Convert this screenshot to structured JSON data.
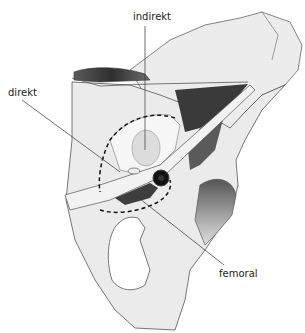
{
  "figure": {
    "type": "anatomical-illustration",
    "labels": {
      "indirect": "indirekt",
      "direct": "direkt",
      "femoral": "femoral"
    },
    "colors": {
      "bone": "#e8e8e8",
      "outline": "#555555",
      "muscle_dark": "#3a3a3a",
      "muscle_mid": "#6a6a6a",
      "dashed_outline": "#111111",
      "leader_line": "#333333",
      "vessel": "#111111"
    }
  }
}
